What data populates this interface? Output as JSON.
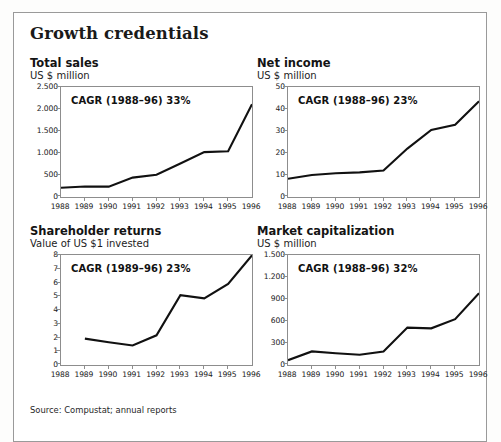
{
  "figure": {
    "title": "Growth credentials",
    "source": "Source: Compustat; annual reports",
    "border_color": "#9a9a9a",
    "line_color": "#111111"
  },
  "chart_data": [
    {
      "type": "line",
      "title": "Total sales",
      "ylabel": "US $ million",
      "xlabel": "",
      "annotation": "CAGR (1988–96) 33%",
      "grid": false,
      "legend": "none",
      "ylim": [
        0,
        2500
      ],
      "yticks": [
        0,
        500,
        1000,
        1500,
        2000,
        2500
      ],
      "ytick_labels": [
        "0",
        "500",
        "1.000",
        "1.500",
        "2.000",
        "2.500"
      ],
      "categories": [
        "1988",
        "1989",
        "1990",
        "1991",
        "1992",
        "1993",
        "1994",
        "1995",
        "1996"
      ],
      "x": [
        1988,
        1989,
        1990,
        1991,
        1992,
        1993,
        1994,
        1995,
        1996
      ],
      "values": [
        210,
        240,
        235,
        440,
        505,
        760,
        1020,
        1040,
        2110
      ]
    },
    {
      "type": "line",
      "title": "Net income",
      "ylabel": "US $ million",
      "xlabel": "",
      "annotation": "CAGR (1988–96) 23%",
      "grid": false,
      "legend": "none",
      "ylim": [
        0,
        50
      ],
      "yticks": [
        0,
        10,
        20,
        30,
        40,
        50
      ],
      "ytick_labels": [
        "0",
        "10",
        "20",
        "30",
        "40",
        "50"
      ],
      "categories": [
        "1988",
        "1989",
        "1990",
        "1991",
        "1992",
        "1993",
        "1994",
        "1995",
        "1996"
      ],
      "x": [
        1988,
        1989,
        1990,
        1991,
        1992,
        1993,
        1994,
        1995,
        1996
      ],
      "values": [
        8.3,
        10.0,
        10.8,
        11.2,
        12.0,
        22.0,
        30.5,
        32.8,
        43.5
      ]
    },
    {
      "type": "line",
      "title": "Shareholder returns",
      "ylabel": "Value of US $1 invested",
      "xlabel": "",
      "annotation": "CAGR (1989–96) 23%",
      "grid": false,
      "legend": "none",
      "ylim": [
        0,
        8
      ],
      "yticks": [
        0,
        1,
        2,
        3,
        4,
        5,
        6,
        7,
        8
      ],
      "ytick_labels": [
        "0",
        "1",
        "2",
        "3",
        "4",
        "5",
        "6",
        "7",
        "8"
      ],
      "categories": [
        "1988",
        "1989",
        "1990",
        "1991",
        "1992",
        "1993",
        "1994",
        "1995",
        "1996"
      ],
      "x": [
        1989,
        1990,
        1991,
        1992,
        1993,
        1994,
        1995,
        1996
      ],
      "values": [
        1.92,
        1.66,
        1.42,
        2.16,
        5.08,
        4.85,
        5.9,
        7.98
      ]
    },
    {
      "type": "line",
      "title": "Market capitalization",
      "ylabel": "US $ million",
      "xlabel": "",
      "annotation": "CAGR (1988–96) 32%",
      "grid": false,
      "legend": "none",
      "ylim": [
        0,
        1500
      ],
      "yticks": [
        0,
        300,
        600,
        900,
        1200,
        1500
      ],
      "ytick_labels": [
        "0",
        "300",
        "600",
        "900",
        "1.200",
        "1.500"
      ],
      "categories": [
        "1988",
        "1989",
        "1990",
        "1991",
        "1992",
        "1993",
        "1994",
        "1995",
        "1996"
      ],
      "x": [
        1988,
        1989,
        1990,
        1991,
        1992,
        1993,
        1994,
        1995,
        1996
      ],
      "values": [
        65,
        185,
        160,
        140,
        185,
        510,
        500,
        625,
        980
      ]
    }
  ]
}
